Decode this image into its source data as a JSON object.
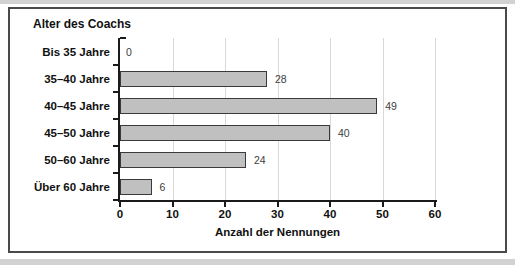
{
  "chart_data": {
    "type": "bar",
    "orientation": "horizontal",
    "title": "Alter des Coachs",
    "categories": [
      "Bis 35 Jahre",
      "35–40 Jahre",
      "40–45 Jahre",
      "45–50 Jahre",
      "50–60 Jahre",
      "Über 60 Jahre"
    ],
    "values": [
      0,
      28,
      49,
      40,
      24,
      6
    ],
    "value_labels": [
      "0",
      "28",
      "49",
      "40",
      "24",
      "6"
    ],
    "xlabel": "Anzahl der Nennungen",
    "xlim": [
      0,
      60
    ],
    "xticks": [
      0,
      10,
      20,
      30,
      40,
      50,
      60
    ],
    "grid": "vertical",
    "legend": "none",
    "bar_color": "#c0c0c0",
    "bar_border_color": "#3a3a3a",
    "gridline_color": "#d8d8d8"
  }
}
